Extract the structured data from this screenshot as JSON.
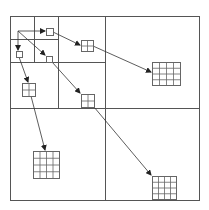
{
  "diagram": {
    "title": "",
    "type": "quadtree-hierarchy",
    "colors": {
      "stroke": "#555555",
      "grid_stroke": "#666666",
      "arrow": "#333333",
      "background": "#ffffff"
    },
    "outer_box": {
      "x": 10,
      "y": 16,
      "w": 189,
      "h": 184
    },
    "partition_lines": [
      {
        "x1": 105,
        "y1": 16,
        "x2": 105,
        "y2": 200
      },
      {
        "x1": 10,
        "y1": 108,
        "x2": 199,
        "y2": 108
      },
      {
        "x1": 58,
        "y1": 16,
        "x2": 58,
        "y2": 108
      },
      {
        "x1": 10,
        "y1": 62,
        "x2": 105,
        "y2": 62
      },
      {
        "x1": 34,
        "y1": 16,
        "x2": 34,
        "y2": 62
      },
      {
        "x1": 10,
        "y1": 39,
        "x2": 58,
        "y2": 39
      }
    ],
    "nodes": [
      {
        "id": "n1a",
        "level": 1,
        "cells": 1,
        "x": 46,
        "y": 28,
        "w": 7,
        "h": 7
      },
      {
        "id": "n1b",
        "level": 1,
        "cells": 1,
        "x": 16,
        "y": 51,
        "w": 6,
        "h": 6
      },
      {
        "id": "n1c",
        "level": 1,
        "cells": 1,
        "x": 46,
        "y": 56,
        "w": 6,
        "h": 6
      },
      {
        "id": "n2a",
        "level": 2,
        "cells": 2,
        "x": 81,
        "y": 40,
        "w": 12,
        "h": 11
      },
      {
        "id": "n2b",
        "level": 2,
        "cells": 2,
        "x": 22,
        "y": 83,
        "w": 13,
        "h": 13
      },
      {
        "id": "n2c",
        "level": 2,
        "cells": 2,
        "x": 81,
        "y": 94,
        "w": 13,
        "h": 13
      },
      {
        "id": "n3a",
        "level": 3,
        "cells": 4,
        "x": 152,
        "y": 62,
        "w": 28,
        "h": 23
      },
      {
        "id": "n3b",
        "level": 3,
        "cells": 4,
        "x": 33,
        "y": 151,
        "w": 26,
        "h": 27
      },
      {
        "id": "n3c",
        "level": 3,
        "cells": 4,
        "x": 152,
        "y": 176,
        "w": 24,
        "h": 23
      }
    ],
    "edges": [
      {
        "from": "origin",
        "to": "n1a",
        "x1": 18,
        "y1": 31,
        "x2": 45,
        "y2": 31,
        "arrow": true
      },
      {
        "from": "origin",
        "to": "n1b",
        "x1": 18,
        "y1": 31,
        "x2": 18,
        "y2": 50,
        "arrow": true
      },
      {
        "from": "origin",
        "to": "n1c",
        "x1": 18,
        "y1": 31,
        "x2": 45,
        "y2": 55,
        "arrow": true
      },
      {
        "from": "n1a",
        "to": "n2a",
        "x1": 53,
        "y1": 32,
        "x2": 80,
        "y2": 45,
        "arrow": true
      },
      {
        "from": "n1b",
        "to": "n2b",
        "x1": 19,
        "y1": 57,
        "x2": 28,
        "y2": 82,
        "arrow": true
      },
      {
        "from": "n1c",
        "to": "n2c",
        "x1": 52,
        "y1": 62,
        "x2": 80,
        "y2": 93,
        "arrow": true
      },
      {
        "from": "n2a",
        "to": "n3a",
        "x1": 93,
        "y1": 46,
        "x2": 151,
        "y2": 72,
        "arrow": true
      },
      {
        "from": "n2b",
        "to": "n3b",
        "x1": 31,
        "y1": 96,
        "x2": 45,
        "y2": 150,
        "arrow": true
      },
      {
        "from": "n2c",
        "to": "n3c",
        "x1": 94,
        "y1": 107,
        "x2": 151,
        "y2": 175,
        "arrow": true
      }
    ],
    "origin": {
      "x": 18,
      "y": 31
    }
  }
}
